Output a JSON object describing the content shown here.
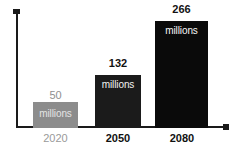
{
  "chart_data": {
    "type": "bar",
    "title": "",
    "subtitle": "",
    "xlabel": "",
    "ylabel": "",
    "grid": false,
    "legend": "none",
    "categories": [
      "2020",
      "2050",
      "2080"
    ],
    "values": [
      50,
      132,
      266
    ],
    "unit_label": "millions",
    "ylim": [
      0,
      266
    ],
    "value_labels": [
      "50",
      "132",
      "266"
    ],
    "bars": [
      {
        "category": "2020",
        "value": 50,
        "value_label": "50",
        "inner_label": "millions",
        "fill_color": "#8c8c8c",
        "inner_text_color": "#e4e4e4",
        "value_text_color": "#8f8f8f",
        "category_text_color": "#9a9a9a"
      },
      {
        "category": "2050",
        "value": 132,
        "value_label": "132",
        "inner_label": "millions",
        "fill_color": "#1b1b1b",
        "inner_text_color": "#f2f2f2",
        "value_text_color": "#121212",
        "category_text_color": "#111111"
      },
      {
        "category": "2080",
        "value": 266,
        "value_label": "266",
        "inner_label": "millions",
        "fill_color": "#0a0a0a",
        "inner_text_color": "#f7f7f7",
        "value_text_color": "#121212",
        "category_text_color": "#111111"
      }
    ],
    "axis_color": "#1a1a1a",
    "background_color": "#ffffff"
  }
}
